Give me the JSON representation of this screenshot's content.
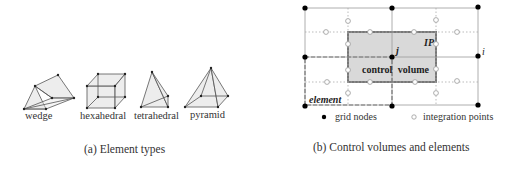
{
  "panel_a": {
    "caption": "(a) Element types",
    "elements": [
      {
        "label": "wedge"
      },
      {
        "label": "hexahedral"
      },
      {
        "label": "tetrahedral"
      },
      {
        "label": "pyramid"
      }
    ]
  },
  "panel_b": {
    "caption": "(b) Control volumes and elements",
    "labels": {
      "control_volume": "control  volume",
      "element": "element",
      "ip": "IP",
      "node_j": "j",
      "node_i": "i"
    },
    "legend": {
      "grid_nodes": "grid nodes",
      "integration_points": "integration points"
    },
    "colors": {
      "control_volume_fill": "#d9d9d9",
      "control_volume_border": "#777777",
      "grid_line": "#999999",
      "node": "#000000"
    }
  }
}
